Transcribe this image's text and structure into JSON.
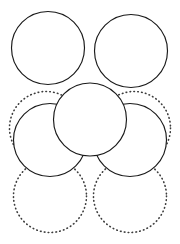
{
  "figure": {
    "name": "close-packed-circles-diagram",
    "canvas": {
      "width": 180,
      "height": 244
    },
    "background_color": "#ffffff",
    "solid_stroke_color": "#1a1a1a",
    "dotted_stroke_color": "#3c3c3c",
    "solid_fill_color": "#ffffff",
    "radius": 36.5,
    "solid_circles": [
      {
        "label": "top-left-circle",
        "cx": 48,
        "cy": 48,
        "r": 36.5
      },
      {
        "label": "top-right-circle",
        "cx": 131,
        "cy": 51,
        "r": 36.5
      },
      {
        "label": "center-circle",
        "cx": 90,
        "cy": 119.5,
        "r": 36.5
      },
      {
        "label": "middle-left-circle",
        "cx": 50,
        "cy": 140,
        "r": 36.5
      },
      {
        "label": "middle-right-circle",
        "cx": 130,
        "cy": 140,
        "r": 36.5
      }
    ],
    "dotted_circles": [
      {
        "label": "left-dotted-circle",
        "cx": 46,
        "cy": 128,
        "r": 36.5
      },
      {
        "label": "right-dotted-circle",
        "cx": 134,
        "cy": 128,
        "r": 36.5
      },
      {
        "label": "bottom-left-dotted-circle",
        "cx": 50,
        "cy": 196,
        "r": 36.5
      },
      {
        "label": "bottom-right-dotted-circle",
        "cx": 130,
        "cy": 196,
        "r": 36.5
      }
    ]
  },
  "chart_data": {
    "type": "scatter",
    "xlabel": "",
    "ylabel": "",
    "xlim": [
      0,
      180
    ],
    "ylim": [
      0,
      244
    ],
    "grid": false,
    "legend": "none",
    "series": [
      {
        "name": "solid circles",
        "style": "solid",
        "radius": 36.5,
        "x": [
          48,
          131,
          90,
          50,
          130
        ],
        "y": [
          48,
          51,
          119.5,
          140,
          140
        ]
      },
      {
        "name": "dotted circles",
        "style": "dotted",
        "radius": 36.5,
        "x": [
          46,
          134,
          50,
          130
        ],
        "y": [
          128,
          128,
          196,
          196
        ]
      }
    ]
  }
}
